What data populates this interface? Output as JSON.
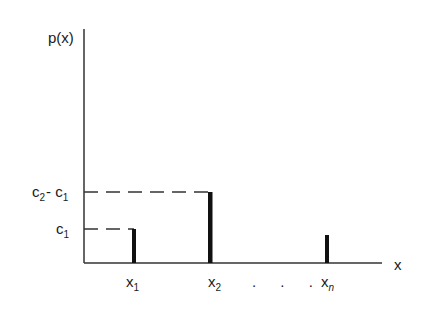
{
  "diagram": {
    "type": "probability-mass-function",
    "y_axis_label": "p(x)",
    "x_axis_label": "x",
    "y_ticks": [
      {
        "label_main": "c",
        "label_sub": "1",
        "label_full": "c1"
      },
      {
        "label_main_a": "c",
        "label_sub_a": "2",
        "label_op": "- ",
        "label_main_b": "c",
        "label_sub_b": "1",
        "label_full": "c2 - c1"
      }
    ],
    "x_ticks": [
      {
        "label_main": "x",
        "label_sub": "1"
      },
      {
        "label_main": "x",
        "label_sub": "2"
      },
      {
        "label_main": "x",
        "label_sub": "n"
      }
    ],
    "ellipsis": ". . .",
    "bars": [
      {
        "x": "x1",
        "height_label": "c1"
      },
      {
        "x": "x2",
        "height_label": "c2 - c1"
      },
      {
        "x": "xn",
        "height_label": ""
      }
    ]
  }
}
